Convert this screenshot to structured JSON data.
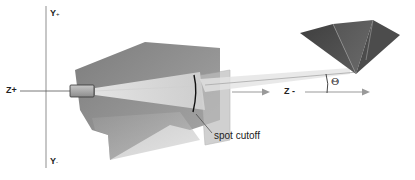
{
  "diagram": {
    "type": "spotlight-geometry",
    "labels": {
      "y_plus": "Y",
      "y_plus_sign": "+",
      "y_minus": "Y",
      "y_minus_sign": "-",
      "z_plus": "Z+",
      "z_minus": "Z -",
      "spot_cutoff": "spot cutoff",
      "theta": "Θ"
    },
    "colors": {
      "background": "#ffffff",
      "axis": "#888888",
      "plane_dark": "#8a8a8a",
      "plane_light": "#b5b5b5",
      "cone": "#e8e8e8",
      "pyramid": "#4a4a4a",
      "cutoff_arc": "#111111"
    }
  }
}
